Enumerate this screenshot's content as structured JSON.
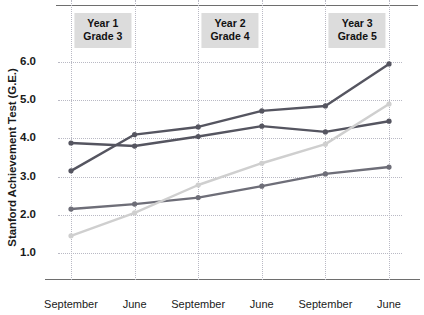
{
  "chart_data": {
    "type": "line",
    "title": "",
    "xlabel": "",
    "ylabel": "Stanford Achievement Test (G.E.)",
    "categories": [
      "September",
      "June",
      "September",
      "June",
      "September",
      "June"
    ],
    "ylim": [
      1.0,
      6.0
    ],
    "yticks": [
      "1.0",
      "2.0",
      "3.0",
      "4.0",
      "5.0",
      "6.0"
    ],
    "ytick_values": [
      1.0,
      2.0,
      3.0,
      4.0,
      5.0,
      6.0
    ],
    "grid": true,
    "legend": "none",
    "series": [
      {
        "name": "series-a-dark-steep",
        "color": "#555560",
        "values": [
          3.15,
          4.1,
          4.3,
          4.72,
          4.85,
          5.95
        ]
      },
      {
        "name": "series-b-dark-gradual",
        "color": "#555560",
        "values": [
          3.88,
          3.8,
          4.05,
          4.32,
          4.17,
          4.45
        ]
      },
      {
        "name": "series-c-medium-gray",
        "color": "#6e6e78",
        "values": [
          2.15,
          2.28,
          2.45,
          2.75,
          3.07,
          3.25
        ]
      },
      {
        "name": "series-d-light-gray",
        "color": "#cfcfcf",
        "values": [
          1.45,
          2.05,
          2.78,
          3.35,
          3.85,
          4.9
        ]
      }
    ],
    "bands": [
      {
        "year": "Year 1",
        "grade": "Grade 3"
      },
      {
        "year": "Year 2",
        "grade": "Grade 4"
      },
      {
        "year": "Year 3",
        "grade": "Grade 5"
      }
    ]
  },
  "colors": {
    "background": "#ffffff",
    "axis": "#6e6e6e",
    "grid": "#b9b9c4",
    "band_background": "#dcdcdc",
    "text": "#1a1a1a"
  }
}
